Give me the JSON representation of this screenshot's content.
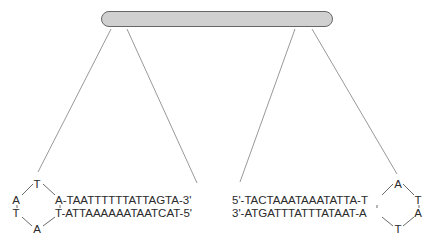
{
  "diagram": {
    "colors": {
      "bar_fill": "#d0d0d0",
      "bar_border": "#666666",
      "lines": "#999999",
      "text": "#2b2b2b"
    },
    "left_hairpin": {
      "loop_bases": {
        "top": "T",
        "left_upper": "A",
        "left_lower": "T",
        "bottom": "A"
      },
      "upper_strand": "A-TAATTTTTTATTAGTA-3'",
      "lower_strand": "T-ATTAAAAAATAATCAT-5'"
    },
    "right_hairpin": {
      "loop_bases": {
        "top": "A",
        "right_upper": "T",
        "right_lower": "A",
        "bottom": "T"
      },
      "upper_strand": "5'-TACTAAATAAATATTA-T",
      "lower_strand": "3'-ATGATTTATTTATAAT-A"
    }
  }
}
